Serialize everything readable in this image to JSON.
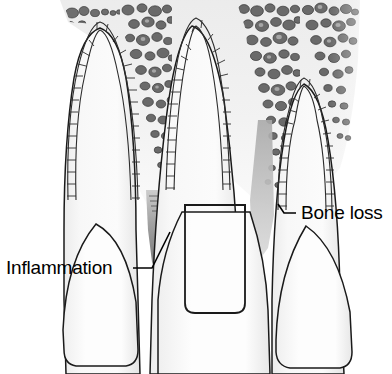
{
  "figure": {
    "name": "periodontal-disease-cross-section",
    "background_color": "#ffffff",
    "line_color": "#1a1a1a",
    "tooth_fill": "#f7f7f7",
    "bone_fill": "#e9e9e9",
    "trabecula_color": "#6a6a6a",
    "inflammation_color": "#8c8c8c",
    "bone_loss_shadow_color": "#b8b8b8"
  },
  "labels": [
    {
      "id": "inflammation",
      "text": "Inflammation",
      "x": 6,
      "y": 274,
      "anchor": "start",
      "leader_from_x": 133,
      "leader_from_y": 268,
      "leader_to_x": 170,
      "leader_to_y": 232
    },
    {
      "id": "bone-loss",
      "text": "Bone loss",
      "x": 301,
      "y": 219,
      "anchor": "start",
      "leader_from_x": 296,
      "leader_from_y": 213,
      "leader_to_x": 274,
      "leader_to_y": 213
    }
  ],
  "anatomy": {
    "teeth": [
      {
        "id": "tooth-left",
        "position": "left",
        "crown_shape": "rounded-dome",
        "root_apex_y": 30
      },
      {
        "id": "tooth-middle",
        "position": "middle",
        "crown_shape": "rectangular-margin",
        "root_apex_y": 28
      },
      {
        "id": "tooth-right",
        "position": "right",
        "crown_shape": "rounded-dome",
        "root_apex_y": 85
      }
    ],
    "features": [
      {
        "id": "lamina-dura",
        "label": "lamina dura socket outline",
        "style": "segmented brick band"
      },
      {
        "id": "trabecular-bone",
        "label": "trabecular alveolar bone",
        "style": "irregular dark blobs"
      },
      {
        "id": "inflammation-wedge",
        "label": "interdental inflammation",
        "style": "dark gray gradient wedge"
      },
      {
        "id": "bone-loss-defect",
        "label": "vertical bone loss defect",
        "style": "deep V notch"
      }
    ]
  }
}
